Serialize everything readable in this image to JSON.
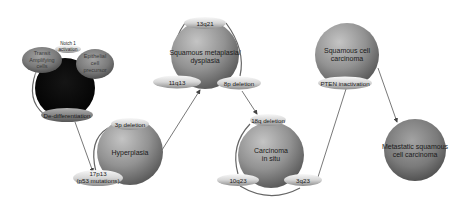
{
  "diagram": {
    "stages": [
      {
        "id": "stem",
        "label": "",
        "fill": "#0a0a0a"
      },
      {
        "id": "hyperplasia",
        "label": "Hyperplasia"
      },
      {
        "id": "dysplasia",
        "label_line1": "Squamous metaplasia/",
        "label_line2": "dysplasia"
      },
      {
        "id": "cis",
        "label_line1": "Carcinoma",
        "label_line2": "in situ"
      },
      {
        "id": "scc",
        "label_line1": "Squamous cell",
        "label_line2": "carcinoma"
      },
      {
        "id": "metastatic",
        "label_line1": "Metastatic squamous",
        "label_line2": "cell carcinoma"
      }
    ],
    "stem_pills": {
      "notch_line1": "Notch 1",
      "notch_line2": "activation",
      "transit_line1": "Transit",
      "transit_line2": "Amplifying",
      "transit_line3": "cells",
      "epithelial_line1": "Epithelial",
      "epithelial_line2": "cell",
      "epithelial_line3": "precursor",
      "dediff": "De-differentiation"
    },
    "hyperplasia_pills": {
      "top": "3p deletion",
      "bottom_line1": "17p13",
      "bottom_line2": "(p53 mutations)"
    },
    "dysplasia_pills": {
      "top": "13q21",
      "left": "11q13",
      "right": "8p deletion"
    },
    "cis_pills": {
      "top": "18q deletion",
      "left": "10q23",
      "right": "3q23"
    },
    "scc_pills": {
      "bottom": "PTEN inactivation"
    },
    "colors": {
      "sphere_light": "#b9b9b9",
      "sphere_mid": "#8f8f8f",
      "sphere_dark": "#5a5a5a",
      "pill_light": "#f2f2f2",
      "pill_dark": "#9a9a9a",
      "stem_pill": "#7a7a7a",
      "arrow": "#555555"
    }
  }
}
